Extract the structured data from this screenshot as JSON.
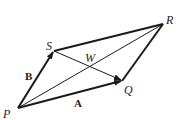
{
  "diagram": {
    "type": "parallelogram-vectors",
    "points": {
      "P": {
        "label": "P",
        "x": 18,
        "y": 108
      },
      "Q": {
        "label": "Q",
        "x": 122,
        "y": 81
      },
      "R": {
        "label": "R",
        "x": 163,
        "y": 24
      },
      "S": {
        "label": "S",
        "x": 54,
        "y": 51
      },
      "W": {
        "label": "W",
        "x": 89,
        "y": 67
      }
    },
    "vectors": [
      {
        "name": "A",
        "label": "A",
        "from": "P",
        "to": "Q"
      },
      {
        "name": "B",
        "label": "B",
        "from": "P",
        "to": "S"
      }
    ],
    "edges": [
      {
        "from": "S",
        "to": "R"
      },
      {
        "from": "Q",
        "to": "R"
      }
    ],
    "diagonals": [
      {
        "from": "P",
        "to": "R"
      },
      {
        "from": "S",
        "to": "Q",
        "arrow": true
      }
    ],
    "colors": {
      "stroke": "#1a1a1a",
      "background": "#ffffff"
    }
  }
}
